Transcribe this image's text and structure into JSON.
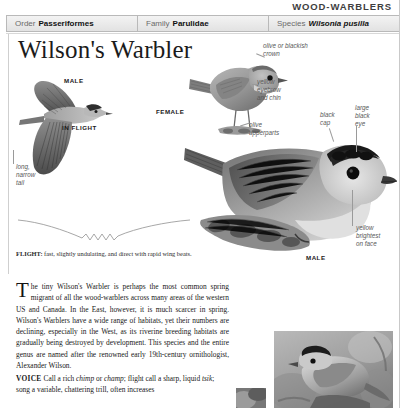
{
  "page": {
    "running_head": "WOOD-WARBLERS",
    "title": "Wilson's Warbler"
  },
  "taxonomy": [
    {
      "key": "Order",
      "value": "Passeriformes",
      "italic": false
    },
    {
      "key": "Family",
      "value": "Parulidae",
      "italic": false
    },
    {
      "key": "Species",
      "value": "Wilsonia pusilla",
      "italic": true
    }
  ],
  "labels": {
    "male_flight": "MALE",
    "in_flight": "IN FLIGHT",
    "female": "FEMALE",
    "male_main": "MALE"
  },
  "annotations": {
    "long_narrow_tail": "long,\nnarrow\ntail",
    "olive_blackish_crown": "olive or blackish\ncrown",
    "yellow_eyebrow_chin": "yellow\neyebrow\nand chin",
    "olive_upperparts": "olive\nupperparts",
    "black_cap": "black\ncap",
    "large_black_eye": "large\nblack\neye",
    "yellow_brightest_face": "yellow\nbrightest\non face"
  },
  "flight_note": {
    "label": "FLIGHT:",
    "text": " fast, slightly undulating, and direct with rapid wing beats."
  },
  "body_text": {
    "dropcap": "T",
    "paragraph": "he tiny Wilson's Warbler is perhaps the most common spring migrant of all the wood-warblers across many areas of the western US and Canada. In the East, however, it is much scarcer in spring. Wilson's Warblers have a wide range of habitats, yet their numbers are declining, especially in the West, as its riverine breeding habitats are gradually being destroyed by development. This species and the entire genus are named after the renowned early 19th-century ornithologist, Alexander Wilson."
  },
  "voice": {
    "heading": "VOICE",
    "part1": "Call a rich ",
    "call1": "chimp",
    "part2": " or ",
    "call2": "champ",
    "part3": "; flight call a sharp, liquid ",
    "call3": "tsik",
    "part4": "; song a variable, chattering trill, often increases"
  },
  "colors": {
    "page_background": "#ffffff",
    "bar_border": "#b9b9b9",
    "bar_fill": "#eaeaea",
    "annotation_text": "#585858",
    "leader_line": "#9a9a9a",
    "title_text": "#1b1b1b"
  }
}
